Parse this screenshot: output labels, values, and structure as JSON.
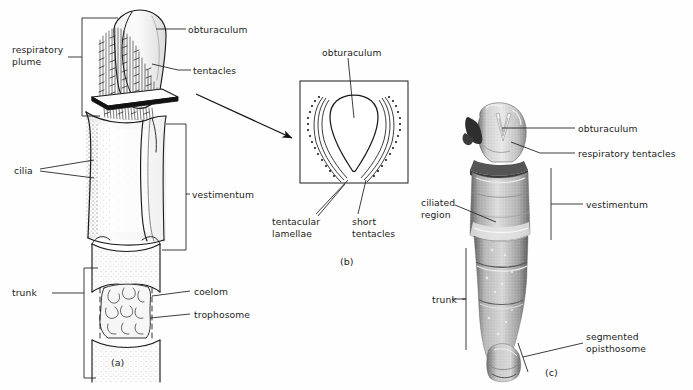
{
  "figure": {
    "background_color": "#fefefe",
    "ink_color": "#1b1b1b",
    "panels": [
      {
        "id": "a",
        "caption": "(a)",
        "type": "line-drawing",
        "description": "Whole anterior end of a vestimentiferan worm, drawn in ink line and stipple"
      },
      {
        "id": "b",
        "caption": "(b)",
        "type": "line-drawing",
        "description": "Cross section through the respiratory plume inside a square frame"
      },
      {
        "id": "c",
        "caption": "(c)",
        "type": "photograph",
        "description": "Grayscale photograph of a preserved specimen"
      }
    ]
  },
  "panel_a": {
    "labels": [
      {
        "name": "respiratory-plume",
        "text": "respiratory\nplume",
        "x": 12,
        "y": 44,
        "align": "left"
      },
      {
        "name": "cilia",
        "text": "cilia",
        "x": 14,
        "y": 165,
        "align": "left"
      },
      {
        "name": "trunk",
        "text": "trunk",
        "x": 12,
        "y": 291,
        "align": "left"
      },
      {
        "name": "obturaculum",
        "text": "obturaculum",
        "x": 188,
        "y": 25,
        "align": "left"
      },
      {
        "name": "tentacles",
        "text": "tentacles",
        "x": 193,
        "y": 66,
        "align": "left"
      },
      {
        "name": "vestimentum",
        "text": "vestimentum",
        "x": 192,
        "y": 190,
        "align": "left"
      },
      {
        "name": "coelom",
        "text": "coelom",
        "x": 194,
        "y": 287,
        "align": "left"
      },
      {
        "name": "trophosome",
        "text": "trophosome",
        "x": 194,
        "y": 310,
        "align": "left"
      }
    ],
    "caption_position": {
      "x": 111,
      "y": 357
    }
  },
  "panel_b": {
    "labels": [
      {
        "name": "obturaculum",
        "text": "obturaculum",
        "x": 322,
        "y": 48,
        "align": "left"
      },
      {
        "name": "tentacular-lamellae",
        "text": "tentacular\nlamellae",
        "x": 272,
        "y": 218,
        "align": "left"
      },
      {
        "name": "short-tentacles",
        "text": "short\ntentacles",
        "x": 352,
        "y": 218,
        "align": "left"
      }
    ],
    "frame": {
      "x": 300,
      "y": 81,
      "width": 108,
      "height": 102
    },
    "caption_position": {
      "x": 340,
      "y": 256
    }
  },
  "panel_c": {
    "labels": [
      {
        "name": "obturaculum",
        "text": "obturaculum",
        "x": 578,
        "y": 126,
        "align": "left"
      },
      {
        "name": "respiratory-tentacles",
        "text": "respiratory tentacles",
        "x": 578,
        "y": 150,
        "align": "left"
      },
      {
        "name": "ciliated-region",
        "text": "ciliated\nregion",
        "x": 421,
        "y": 199,
        "align": "left"
      },
      {
        "name": "vestimentum",
        "text": "vestimentum",
        "x": 586,
        "y": 201,
        "align": "left"
      },
      {
        "name": "trunk",
        "text": "trunk",
        "x": 432,
        "y": 296,
        "align": "left"
      },
      {
        "name": "segmented-opisthosome",
        "text": "segmented\nopisthosome",
        "x": 586,
        "y": 334,
        "align": "left"
      }
    ],
    "caption_position": {
      "x": 545,
      "y": 367
    }
  }
}
